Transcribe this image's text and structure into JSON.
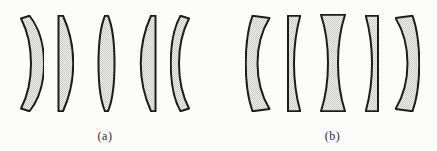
{
  "figure": {
    "background": "#fcfcfb",
    "outline_color": "#1c1c1c",
    "fill_base": "#f2f2f0",
    "fill_dot": "#c6c6c4",
    "label_color": "#2b2b2b",
    "groups": [
      {
        "label": "(a)",
        "name": "converging-lenses",
        "lenses": [
          {
            "type": "convex-meniscus-concave-left",
            "x": 14,
            "y": 15,
            "w": 30,
            "h": 97,
            "path": "M 7,3.5 L 15.5,0.75 C 26,14 30,31 30,48.5 C 30,66 26,83 15.5,96.25 L 7,93.5 C 14,80 17,64 17,48.5 C 17,33 14,17 7,3.5 Z"
          },
          {
            "type": "plano-convex-flat-left",
            "x": 57,
            "y": 15,
            "w": 17,
            "h": 97,
            "path": "M 1.5,0.75 L 6,0.75 C 12,14 16.25,31 16.25,48.5 C 16.25,66 12,83 6,96.25 L 1.5,96.25 Z"
          },
          {
            "type": "biconvex",
            "x": 97,
            "y": 15,
            "w": 19,
            "h": 97,
            "path": "M 8,0.75 L 11,0.75 C 14.5,9 17.5,27 17.5,48.5 C 17.5,70 14.5,88 11,96.25 L 8,96.25 C 4.5,88 1.5,70 1.5,48.5 C 1.5,27 4.5,9 8,0.75 Z"
          },
          {
            "type": "plano-convex-flat-right",
            "x": 139,
            "y": 15,
            "w": 18,
            "h": 97,
            "path": "M 16.5,0.75 L 12,0.75 C 6,14 1.75,31 1.75,48.5 C 1.75,66 6,83 12,96.25 L 16.5,96.25 Z"
          },
          {
            "type": "convex-meniscus-concave-right",
            "x": 170,
            "y": 15,
            "w": 26,
            "h": 97,
            "path": "M 19,3.5 L 10.5,0.75 C 3,14 0.75,31 0.75,48.5 C 0.75,66 3,83 10.5,96.25 L 19,93.5 C 12,80 9,64 9,48.5 C 9,33 12,17 19,3.5 Z"
          }
        ]
      },
      {
        "label": "(b)",
        "name": "diverging-lenses",
        "lenses": [
          {
            "type": "concave-meniscus-convex-left",
            "x": 245,
            "y": 15,
            "w": 26,
            "h": 97,
            "path": "M 7.5,0.75 L 24.5,3 C 16,17 12.5,33 12.5,48.5 C 12.5,64 16,80 24.5,94 L 7.5,96.25 C 2,81 0.75,65 0.75,48.5 C 0.75,32 2,16 7.5,0.75 Z"
          },
          {
            "type": "plano-concave-flat-left",
            "x": 287,
            "y": 15,
            "w": 14,
            "h": 97,
            "path": "M 1,0.75 L 13.25,0.75 C 9,16 7,32 7,48.5 C 7,65 9,81 13.25,96.25 L 1,96.25 Z"
          },
          {
            "type": "biconcave",
            "x": 320,
            "y": 14,
            "w": 26,
            "h": 98,
            "path": "M 1,0.75 L 25,0.75 C 20,16 18,32 18,49 C 18,66 20,82 25,97.25 L 1,97.25 C 6,82 8,66 8,49 C 8,32 6,16 1,0.75 Z"
          },
          {
            "type": "plano-concave-flat-right",
            "x": 365,
            "y": 15,
            "w": 14,
            "h": 97,
            "path": "M 13,0.75 L 0.75,0.75 C 5,16 7,32 7,48.5 C 7,65 5,81 0.75,96.25 L 13,96.25 Z"
          },
          {
            "type": "concave-meniscus-convex-right",
            "x": 395,
            "y": 15,
            "w": 25,
            "h": 97,
            "path": "M 17.5,0.75 L 0.5,3 C 9,17 12.5,33 12.5,48.5 C 12.5,64 9,80 0.5,94 L 17.5,96.25 C 23,81 24.25,65 24.25,48.5 C 24.25,32 23,16 17.5,0.75 Z"
          }
        ]
      }
    ]
  }
}
